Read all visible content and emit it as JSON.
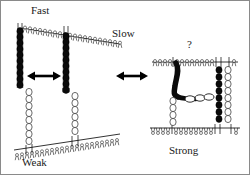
{
  "figure": {
    "type": "scientific-schematic",
    "title": "",
    "background_color": "#ffffff",
    "ink_color": "#000000",
    "border_color": "#8a8a8a",
    "width": 250,
    "height": 175
  },
  "labels": {
    "fast": "Fast",
    "slow": "Slow",
    "weak": "Weak",
    "strong": "Strong",
    "question": "?"
  },
  "panels": [
    {
      "id": "panel-left",
      "description": "Two dark filaments spanning an upper membrane and two pale filaments on a lower membrane, connected by a horizontal double-headed arrow.",
      "labels": [
        "Fast",
        "Weak"
      ]
    },
    {
      "id": "panel-right",
      "description": "A dark bent filament and a pale filament bridging an upper and a lower membrane, plus a dark filament column at the right edge.",
      "labels": [
        "Strong",
        "?"
      ]
    }
  ],
  "arrows": [
    {
      "id": "arrow-left",
      "style": "double-headed-horizontal"
    },
    {
      "id": "arrow-center",
      "style": "double-headed-horizontal"
    }
  ]
}
